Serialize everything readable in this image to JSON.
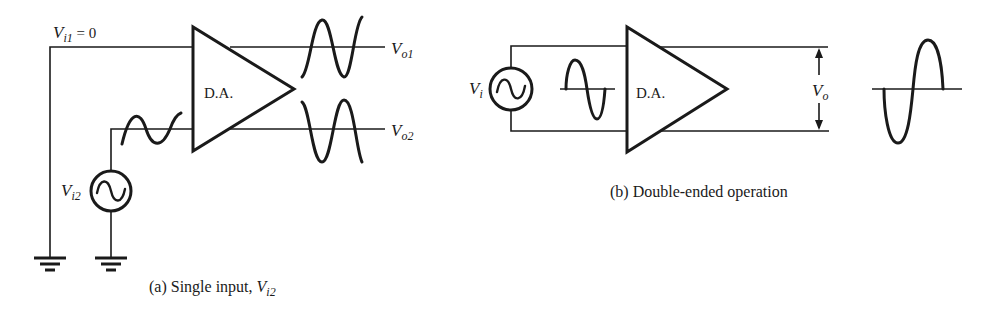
{
  "figure": {
    "part_a": {
      "caption_prefix": "(a) Single input, ",
      "caption_var": "V",
      "caption_sub": "i2",
      "amplifier_label": "D.A.",
      "input1": {
        "var": "V",
        "sub": "i1",
        "suffix": " = 0"
      },
      "input2": {
        "var": "V",
        "sub": "i2"
      },
      "output1": {
        "var": "V",
        "sub": "o1"
      },
      "output2": {
        "var": "V",
        "sub": "o2"
      }
    },
    "part_b": {
      "caption": "(b) Double-ended operation",
      "amplifier_label": "D.A.",
      "input": {
        "var": "V",
        "sub": "i"
      },
      "output": {
        "var": "V",
        "sub": "o"
      }
    }
  }
}
